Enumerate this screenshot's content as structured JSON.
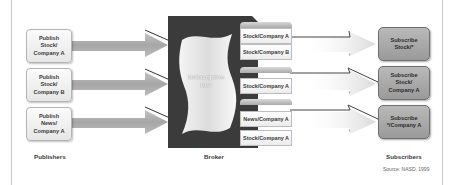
{
  "publishers": {
    "label": "Publishers",
    "items": [
      {
        "text": "Publish\nStock/\nCompany A"
      },
      {
        "text": "Publish\nStock/\nCompany B"
      },
      {
        "text": "Publish\nNews/\nCompany A"
      }
    ]
  },
  "broker": {
    "label": "Broker",
    "subscription_list": "Subscription\nList",
    "topics": [
      {
        "text": "Stock/Company A"
      },
      {
        "text": "Stock/Company B"
      },
      {
        "text": "Stock/Company A"
      },
      {
        "text": "News/Company A"
      },
      {
        "text": "Stock/Company A"
      }
    ]
  },
  "subscribers": {
    "label": "Subscribers",
    "items": [
      {
        "text": "Subscribe\nStock/*"
      },
      {
        "text": "Subscribe\nStock/\nCompany A"
      },
      {
        "text": "Subscribe\n*/Company A"
      }
    ]
  },
  "source": "Source: NASD, 1999",
  "colors": {
    "broker_body": "#3b3b3b",
    "arrow_fill": "#a8a8a8",
    "subscriber_fill": "#a9a9a9",
    "publisher_fill": "#f0f0f0"
  }
}
